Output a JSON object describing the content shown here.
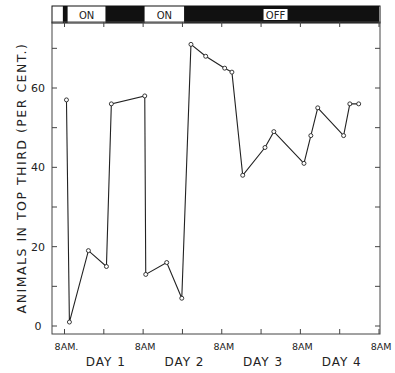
{
  "chart_data": {
    "type": "line",
    "title": "",
    "xlabel": "",
    "ylabel": "ANIMALS IN TOP THIRD (PER CENT.)",
    "ylim": [
      0,
      75
    ],
    "y_ticks": [
      0,
      20,
      40,
      60
    ],
    "x_tick_labels": [
      "8AM.",
      "8AM",
      "8AM",
      "8AM",
      "8AM"
    ],
    "day_labels": [
      "DAY 1",
      "DAY 2",
      "DAY 3",
      "DAY 4"
    ],
    "x_range_hours": [
      0,
      96
    ],
    "light_bar": [
      {
        "label": "",
        "state": "off",
        "start_h": -0.5,
        "end_h": 1
      },
      {
        "label": "ON",
        "state": "on",
        "start_h": 1,
        "end_h": 12.5
      },
      {
        "label": "",
        "state": "off",
        "start_h": 12.5,
        "end_h": 24.5
      },
      {
        "label": "ON",
        "state": "on",
        "start_h": 24.5,
        "end_h": 36.5
      },
      {
        "label": "OFF",
        "state": "off",
        "start_h": 36.5,
        "end_h": 96
      }
    ],
    "series": [
      {
        "name": "Animals in top third",
        "x_hours": [
          0.6,
          1.5,
          7.3,
          12.8,
          14.3,
          24.5,
          24.8,
          31.2,
          35.8,
          38.6,
          43.1,
          48.9,
          51.1,
          54.4,
          61.2,
          63.9,
          73.1,
          75.2,
          77.3,
          85.2,
          87.1,
          89.8
        ],
        "values": [
          57,
          1,
          19,
          15,
          56,
          58,
          13,
          16,
          7,
          71,
          68,
          65,
          64,
          38,
          45,
          49,
          41,
          48,
          55,
          48,
          56,
          56
        ]
      }
    ],
    "grid": false,
    "legend": null
  }
}
